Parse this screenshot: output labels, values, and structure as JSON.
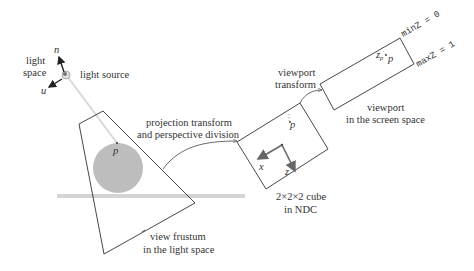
{
  "light": {
    "space_label_line1": "light",
    "space_label_line2": "space",
    "source_label": "light source",
    "axis_n": "n",
    "axis_u": "u"
  },
  "frustum": {
    "point_label": "p",
    "caption_line1": "view frustum",
    "caption_line2": "in the light space"
  },
  "projection": {
    "label_line1": "projection transform",
    "label_line2": "and perspective division"
  },
  "ndc": {
    "point_label": "p",
    "axis_x": "x",
    "axis_z": "z",
    "caption_line1": "2×2×2 cube",
    "caption_line2": "in NDC"
  },
  "viewport_transform": {
    "label_line1": "viewport",
    "label_line2": "transform"
  },
  "viewport": {
    "point_label": "p",
    "depth_label": "z",
    "depth_subscript": "p",
    "min_label": "minZ = 0",
    "max_label": "maxZ = 1",
    "caption_line1": "viewport",
    "caption_line2": "in the screen space"
  },
  "colors": {
    "line": "#333333",
    "sphere": "#bdbdbd",
    "ground": "#d4d4d4",
    "ray": "#d8d8d8",
    "axis_arrow": "#555555"
  }
}
